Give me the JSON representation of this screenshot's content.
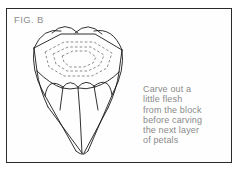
{
  "figure": {
    "label": "FIG. B",
    "border_color": "#2a2a2a",
    "background_color": "#ffffff",
    "line_color": "#1a1a1a",
    "dashed_line_color": "#7a7a7a",
    "text_color": "#8a8a8a"
  },
  "caption": {
    "lines": [
      "Carve out a",
      "little flesh",
      "from the block",
      "before carving",
      "the next layer",
      "of petals"
    ],
    "full_text": "Carve out a little flesh from the block before carving the next layer of petals"
  },
  "drawing": {
    "subject": "carved-flower-block",
    "description": "Line drawing of a block carved into a lotus-like flower with scalloped petals and a tapered base",
    "top_petal_arcs": 4,
    "front_petal_arcs": 3,
    "dashed_contour_rings": 3
  }
}
